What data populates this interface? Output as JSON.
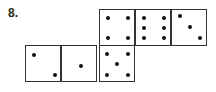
{
  "problem": {
    "number_label": "8."
  },
  "net": {
    "faces": [
      {
        "id": "top-1",
        "value": 4,
        "left": 99,
        "top": 9,
        "pips": [
          [
            8,
            8
          ],
          [
            28,
            8
          ],
          [
            8,
            28
          ],
          [
            28,
            28
          ]
        ]
      },
      {
        "id": "top-2",
        "value": 6,
        "left": 135,
        "top": 9,
        "pips": [
          [
            8,
            8
          ],
          [
            28,
            8
          ],
          [
            8,
            18
          ],
          [
            28,
            18
          ],
          [
            8,
            28
          ],
          [
            28,
            28
          ]
        ]
      },
      {
        "id": "top-3",
        "value": 3,
        "left": 171,
        "top": 9,
        "pips": [
          [
            8,
            6
          ],
          [
            18,
            17
          ],
          [
            28,
            28
          ]
        ]
      },
      {
        "id": "bottom-1",
        "value": 2,
        "left": 25,
        "top": 45,
        "pips": [
          [
            8,
            9
          ],
          [
            29,
            29
          ]
        ]
      },
      {
        "id": "bottom-2",
        "value": 1,
        "left": 61,
        "top": 45,
        "pips": [
          [
            19,
            20
          ]
        ]
      },
      {
        "id": "bottom-3",
        "value": 5,
        "left": 99,
        "top": 45,
        "pips": [
          [
            7,
            8
          ],
          [
            28,
            8
          ],
          [
            17,
            18
          ],
          [
            7,
            29
          ],
          [
            28,
            29
          ]
        ]
      }
    ]
  }
}
